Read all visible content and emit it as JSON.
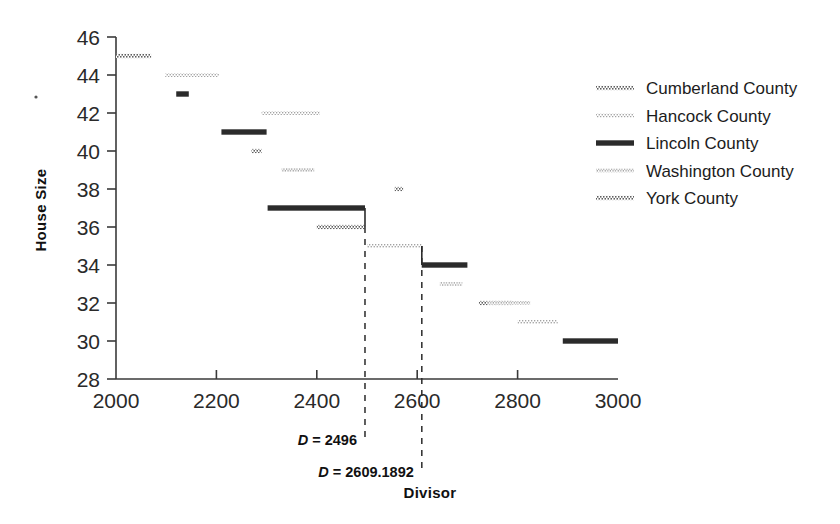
{
  "chart_data": {
    "type": "line",
    "title": "",
    "xlabel": "Divisor",
    "ylabel": "House Size",
    "xlim": [
      2000,
      3000
    ],
    "ylim": [
      28,
      46
    ],
    "xticks": [
      2000,
      2200,
      2400,
      2600,
      2800,
      3000
    ],
    "xtick_labels": [
      "2000",
      "2200",
      "2400",
      "2600",
      "2800",
      "3000"
    ],
    "yticks": [
      28,
      30,
      32,
      34,
      36,
      38,
      40,
      42,
      44,
      46
    ],
    "ytick_labels": [
      "28",
      "30",
      "32",
      "34",
      "36",
      "38",
      "40",
      "42",
      "44",
      "46"
    ],
    "grid": false,
    "legend_position": "upper right",
    "series": [
      {
        "name": "Cumberland County",
        "style": "dotted-medium",
        "color": "#6b6b6b",
        "segments": [
          {
            "x0": 2000,
            "x1": 2070,
            "y": 45
          },
          {
            "x0": 2400,
            "x1": 2496,
            "y": 36
          },
          {
            "x0": 2723,
            "x1": 2790,
            "y": 32
          }
        ]
      },
      {
        "name": "Hancock County",
        "style": "dotted-light",
        "color": "#9a9a9a",
        "segments": [
          {
            "x0": 2098,
            "x1": 2205,
            "y": 44
          },
          {
            "x0": 2290,
            "x1": 2406,
            "y": 42
          },
          {
            "x0": 2500,
            "x1": 2609,
            "y": 35
          },
          {
            "x0": 2800,
            "x1": 2880,
            "y": 31
          }
        ]
      },
      {
        "name": "Lincoln County",
        "style": "solid-heavy",
        "color": "#2b2b2b",
        "segments": [
          {
            "x0": 2120,
            "x1": 2145,
            "y": 43
          },
          {
            "x0": 2210,
            "x1": 2300,
            "y": 41
          },
          {
            "x0": 2302,
            "x1": 2496,
            "y": 37
          },
          {
            "x0": 2609,
            "x1": 2700,
            "y": 34
          },
          {
            "x0": 2890,
            "x1": 3000,
            "y": 30
          }
        ]
      },
      {
        "name": "Washington County",
        "style": "dotted-fine",
        "color": "#8a8a8a",
        "segments": [
          {
            "x0": 2330,
            "x1": 2395,
            "y": 39
          },
          {
            "x0": 2645,
            "x1": 2690,
            "y": 33
          },
          {
            "x0": 2740,
            "x1": 2825,
            "y": 32
          }
        ]
      },
      {
        "name": "York County",
        "style": "dotted-medium",
        "color": "#6b6b6b",
        "segments": [
          {
            "x0": 2270,
            "x1": 2290,
            "y": 40
          },
          {
            "x0": 2555,
            "x1": 2572,
            "y": 38
          }
        ]
      }
    ],
    "annotations": [
      {
        "name": "divisor-2496",
        "label": "D = 2496",
        "x": 2496
      },
      {
        "name": "divisor-2609",
        "label": "D = 2609.1892",
        "x": 2609.1892
      }
    ]
  },
  "legend": {
    "entries": [
      {
        "label": "Cumberland County",
        "marker": "dotted-medium"
      },
      {
        "label": "Hancock County",
        "marker": "dotted-light"
      },
      {
        "label": "Lincoln County",
        "marker": "solid-heavy"
      },
      {
        "label": "Washington County",
        "marker": "dotted-fine"
      },
      {
        "label": "York County",
        "marker": "dotted-medium"
      }
    ]
  },
  "axes": {
    "y_title": "House Size",
    "x_title": "Divisor"
  },
  "annotations": {
    "first": "D = 2496",
    "second": "D = 2609.1892"
  }
}
